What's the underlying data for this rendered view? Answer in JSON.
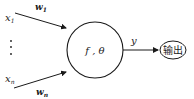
{
  "diagram": {
    "title": "",
    "inputs": [
      {
        "label": "x",
        "subscript": "1",
        "weight_label": "w",
        "weight_subscript": "1"
      },
      {
        "label": "x",
        "subscript": "n",
        "weight_label": "w",
        "weight_subscript": "n"
      }
    ],
    "ellipsis": "⋮",
    "neuron": {
      "label": "f , θ"
    },
    "output_edge": {
      "label": "y"
    },
    "output_node": {
      "label": "输出"
    },
    "colors": {
      "stroke": "#1a1a1a",
      "background": "#ffffff"
    }
  }
}
